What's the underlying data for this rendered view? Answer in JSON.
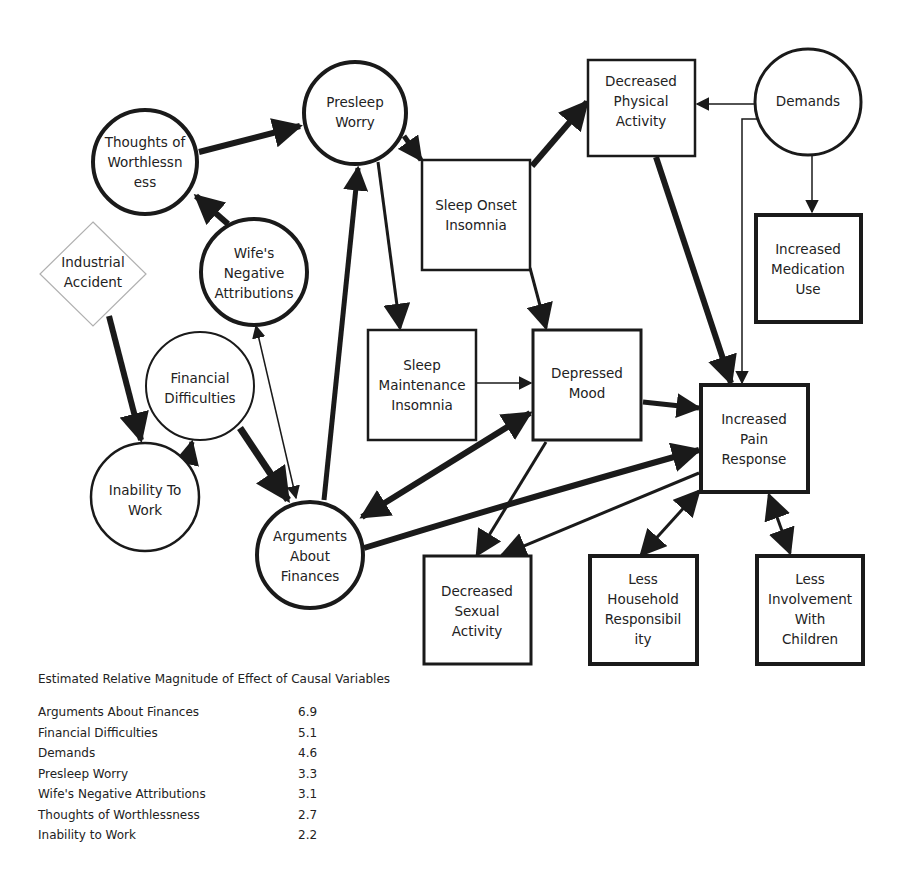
{
  "diagram": {
    "nodes": [
      {
        "id": "presleep_worry",
        "shape": "circle",
        "label_lines": [
          "Presleep",
          "Worry"
        ]
      },
      {
        "id": "thoughts_worthlessness",
        "shape": "circle",
        "label_lines": [
          "Thoughts of",
          "Worthlessn",
          "ess"
        ]
      },
      {
        "id": "wifes_negative_attributions",
        "shape": "circle",
        "label_lines": [
          "Wife's",
          "Negative",
          "Attributions"
        ]
      },
      {
        "id": "industrial_accident",
        "shape": "diamond",
        "label_lines": [
          "Industrial",
          "Accident"
        ]
      },
      {
        "id": "financial_difficulties",
        "shape": "circle",
        "label_lines": [
          "Financial",
          "Difficulties"
        ]
      },
      {
        "id": "inability_to_work",
        "shape": "circle",
        "label_lines": [
          "Inability To",
          "Work"
        ]
      },
      {
        "id": "arguments_about_finances",
        "shape": "circle",
        "label_lines": [
          "Arguments",
          "About",
          "Finances"
        ]
      },
      {
        "id": "sleep_onset_insomnia",
        "shape": "box",
        "label_lines": [
          "Sleep Onset",
          "Insomnia"
        ]
      },
      {
        "id": "decreased_physical_activity",
        "shape": "box",
        "label_lines": [
          "Decreased",
          "Physical",
          "Activity"
        ]
      },
      {
        "id": "demands",
        "shape": "circle",
        "label_lines": [
          "Demands"
        ]
      },
      {
        "id": "increased_medication_use",
        "shape": "box",
        "label_lines": [
          "Increased",
          "Medication",
          "Use"
        ]
      },
      {
        "id": "sleep_maintenance_insomnia",
        "shape": "box",
        "label_lines": [
          "Sleep",
          "Maintenance",
          "Insomnia"
        ]
      },
      {
        "id": "depressed_mood",
        "shape": "box",
        "label_lines": [
          "Depressed",
          "Mood"
        ]
      },
      {
        "id": "increased_pain_response",
        "shape": "box",
        "label_lines": [
          "Increased",
          "Pain",
          "Response"
        ]
      },
      {
        "id": "decreased_sexual_activity",
        "shape": "box",
        "label_lines": [
          "Decreased",
          "Sexual",
          "Activity"
        ]
      },
      {
        "id": "less_household_responsibility",
        "shape": "box",
        "label_lines": [
          "Less",
          "Household",
          "Responsibil",
          "ity"
        ]
      },
      {
        "id": "less_involvement_children",
        "shape": "box",
        "label_lines": [
          "Less",
          "Involvement",
          "With",
          "Children"
        ]
      }
    ],
    "edges": [
      {
        "from": "thoughts_worthlessness",
        "to": "presleep_worry",
        "weight": "thick"
      },
      {
        "from": "wifes_negative_attributions",
        "to": "thoughts_worthlessness",
        "weight": "thick"
      },
      {
        "from": "industrial_accident",
        "to": "inability_to_work",
        "weight": "thick"
      },
      {
        "from": "inability_to_work",
        "to": "financial_difficulties",
        "weight": "thick"
      },
      {
        "from": "financial_difficulties",
        "to": "arguments_about_finances",
        "weight": "thick"
      },
      {
        "from": "arguments_about_finances",
        "to": "wifes_negative_attributions",
        "weight": "thin",
        "bidirectional": true
      },
      {
        "from": "arguments_about_finances",
        "to": "presleep_worry",
        "weight": "thick"
      },
      {
        "from": "presleep_worry",
        "to": "sleep_onset_insomnia",
        "weight": "thick"
      },
      {
        "from": "presleep_worry",
        "to": "sleep_maintenance_insomnia",
        "weight": "medium"
      },
      {
        "from": "sleep_onset_insomnia",
        "to": "decreased_physical_activity",
        "weight": "thick"
      },
      {
        "from": "sleep_onset_insomnia",
        "to": "depressed_mood",
        "weight": "medium"
      },
      {
        "from": "demands",
        "to": "decreased_physical_activity",
        "weight": "thin"
      },
      {
        "from": "demands",
        "to": "increased_medication_use",
        "weight": "thin"
      },
      {
        "from": "demands",
        "to": "increased_pain_response",
        "weight": "thin"
      },
      {
        "from": "decreased_physical_activity",
        "to": "increased_pain_response",
        "weight": "thick"
      },
      {
        "from": "sleep_maintenance_insomnia",
        "to": "depressed_mood",
        "weight": "thin"
      },
      {
        "from": "depressed_mood",
        "to": "increased_pain_response",
        "weight": "thick"
      },
      {
        "from": "arguments_about_finances",
        "to": "depressed_mood",
        "weight": "thick",
        "bidirectional": true
      },
      {
        "from": "arguments_about_finances",
        "to": "increased_pain_response",
        "weight": "thick"
      },
      {
        "from": "depressed_mood",
        "to": "decreased_sexual_activity",
        "weight": "medium"
      },
      {
        "from": "increased_pain_response",
        "to": "decreased_sexual_activity",
        "weight": "medium"
      },
      {
        "from": "increased_pain_response",
        "to": "less_household_responsibility",
        "weight": "medium",
        "bidirectional": true
      },
      {
        "from": "increased_pain_response",
        "to": "less_involvement_children",
        "weight": "medium",
        "bidirectional": true
      }
    ]
  },
  "legend": {
    "title": "Estimated Relative Magnitude of Effect of Causal Variables",
    "rows": [
      {
        "name": "Arguments About Finances",
        "value": "6.9"
      },
      {
        "name": "Financial Difficulties",
        "value": "5.1"
      },
      {
        "name": "Demands",
        "value": "4.6"
      },
      {
        "name": "Presleep Worry",
        "value": "3.3"
      },
      {
        "name": "Wife's Negative Attributions",
        "value": "3.1"
      },
      {
        "name": "Thoughts of Worthlessness",
        "value": "2.7"
      },
      {
        "name": "Inability to Work",
        "value": "2.2"
      }
    ]
  },
  "colors": {
    "stroke": "#1a1a1a",
    "diamond_stroke": "#b0b0b0",
    "background": "#ffffff"
  }
}
